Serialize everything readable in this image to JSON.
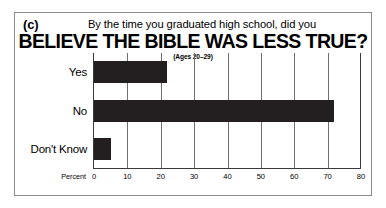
{
  "figure": {
    "panel_letter": "(c)",
    "question": "By the time you graduated high school, did you",
    "headline": "BELIEVE THE BIBLE WAS LESS TRUE?",
    "subtitle": "(Ages 20–29)"
  },
  "chart_data": {
    "type": "bar",
    "orientation": "horizontal",
    "title": "BELIEVE THE BIBLE WAS LESS TRUE?",
    "subtitle": "(Ages 20–29)",
    "question": "By the time you graduated high school, did you",
    "categories": [
      "Yes",
      "No",
      "Don't Know"
    ],
    "values": [
      22,
      72,
      5
    ],
    "xlabel": "Percent",
    "ylabel": "",
    "xlim": [
      0,
      80
    ],
    "xticks": [
      0,
      10,
      20,
      30,
      40,
      50,
      60,
      70,
      80
    ],
    "xtick_labels": [
      "0",
      "10",
      "20",
      "30",
      "40",
      "50",
      "60",
      "70",
      "80"
    ],
    "grid": "vertical",
    "legend": "none",
    "bar_color": "#231f20"
  }
}
